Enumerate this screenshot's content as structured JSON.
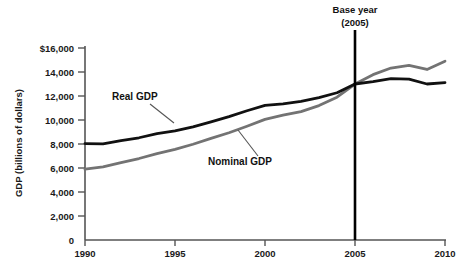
{
  "chart_data": {
    "type": "line",
    "title": "",
    "xlabel": "",
    "ylabel": "GDP (billions of dollars)",
    "xlim": [
      1990,
      2010
    ],
    "ylim": [
      0,
      16000
    ],
    "grid": false,
    "legend": "inline-annotations",
    "x_ticks": [
      "1990",
      "1995",
      "2000",
      "2005",
      "2010"
    ],
    "x_tick_values": [
      1990,
      1995,
      2000,
      2005,
      2010
    ],
    "y_ticks": [
      "0",
      "2,000",
      "4,000",
      "6,000",
      "8,000",
      "10,000",
      "12,000",
      "14,000",
      "$16,000"
    ],
    "y_tick_values": [
      0,
      2000,
      4000,
      6000,
      8000,
      10000,
      12000,
      14000,
      16000
    ],
    "x": [
      1990,
      1991,
      1992,
      1993,
      1994,
      1995,
      1996,
      1997,
      1998,
      1999,
      2000,
      2001,
      2002,
      2003,
      2004,
      2005,
      2006,
      2007,
      2008,
      2009,
      2010
    ],
    "series": [
      {
        "name": "Real GDP",
        "color": "#111111",
        "values": [
          8030,
          8010,
          8290,
          8520,
          8870,
          9090,
          9430,
          9850,
          10280,
          10770,
          11220,
          11350,
          11550,
          11860,
          12270,
          13000,
          13200,
          13440,
          13400,
          13000,
          13120
        ]
      },
      {
        "name": "Nominal GDP",
        "color": "#737373",
        "values": [
          5900,
          6100,
          6450,
          6790,
          7200,
          7550,
          7980,
          8470,
          8940,
          9480,
          10050,
          10400,
          10700,
          11200,
          11900,
          13000,
          13780,
          14330,
          14560,
          14210,
          14900
        ]
      }
    ],
    "annotations": [
      {
        "id": "base-year",
        "text_line1": "Base year",
        "text_line2": "(2005)",
        "x_value": 2005
      },
      {
        "id": "real-gdp-callout",
        "text": "Real GDP"
      },
      {
        "id": "nominal-gdp-callout",
        "text": "Nominal GDP"
      }
    ],
    "colors": {
      "real_gdp": "#111111",
      "nominal_gdp": "#737373",
      "axis": "#555555",
      "base_year_line": "#000000",
      "background": "#ffffff"
    }
  }
}
